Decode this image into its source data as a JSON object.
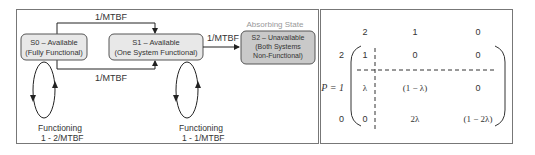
{
  "state_diagram": {
    "states": [
      {
        "id": "S0",
        "line1": "S0 – Available",
        "line2": "(Fully Functional)"
      },
      {
        "id": "S1",
        "line1": "S1 – Available",
        "line2": "(One System Functional)"
      },
      {
        "id": "S2",
        "line1": "S2 – Unavailable",
        "line2": "(Both Systems",
        "line3": "Non-Functional)"
      }
    ],
    "absorbing_label": "Absorbing State",
    "transitions": {
      "s0_to_s1_top": "1/MTBF",
      "s0_to_s1_bottom": "1/MTBF",
      "s1_to_s2": "1/MTBF"
    },
    "self_loops": [
      {
        "state": "S0",
        "line1": "Functioning",
        "line2": "1 - 2/MTBF"
      },
      {
        "state": "S1",
        "line1": "Functioning",
        "line2": "1 - 1/MTBF"
      }
    ]
  },
  "matrix": {
    "label": "P = 1",
    "col_headers": [
      "2",
      "1",
      "0"
    ],
    "row_headers": [
      "2",
      "",
      "0"
    ],
    "rows": [
      [
        "1",
        "0",
        "0"
      ],
      [
        "λ",
        "(1 − λ)",
        "0"
      ],
      [
        "0",
        "2λ",
        "(1 − 2λ)"
      ]
    ]
  }
}
